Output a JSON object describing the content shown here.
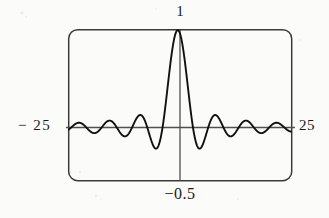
{
  "figure": {
    "kind": "graphing-calculator-plot",
    "frame": {
      "x": 68,
      "y": 29,
      "width": 224,
      "height": 152,
      "corner_radius": 9,
      "stroke": "#3a3a3a",
      "stroke_width": 1.4
    },
    "axis_color": "#4a4a4a",
    "curve_color": "#111111",
    "curve_width": 1.9,
    "background": "#fbfbf9"
  },
  "labels": {
    "top": "1",
    "bottom": "−0.5",
    "left": "− 25",
    "right": "25"
  },
  "chart_data": {
    "type": "line",
    "title": "",
    "xlabel": "",
    "ylabel": "",
    "xlim": [
      -25,
      25
    ],
    "ylim": [
      -0.33,
      1.0
    ],
    "grid": false,
    "legend": null,
    "x_tick_labels": [
      "− 25",
      "25"
    ],
    "y_tick_labels": [
      "1"
    ],
    "annotations": [
      {
        "text": "1",
        "position": "top-center",
        "meaning": "maximum value of the curve"
      },
      {
        "text": "−0.5",
        "position": "bottom-center",
        "meaning": "x-coordinate of the central peak / vertical cursor line"
      },
      {
        "text": "− 25",
        "position": "left",
        "meaning": "left x-window bound"
      },
      {
        "text": "25",
        "position": "right",
        "meaning": "right x-window bound"
      }
    ],
    "cursor_line": {
      "orientation": "vertical",
      "x": -0.5
    },
    "axis_line": {
      "orientation": "horizontal",
      "y": 0
    },
    "function": "damped oscillating sinc-like wave, peak 1 at x = -0.5",
    "series": [
      {
        "name": "sinc",
        "peak_value": 1,
        "peak_x": -0.5,
        "samples": 1400,
        "lobe_half_period": 3.4,
        "envelope": "1/|k*(x+0.5)|"
      }
    ]
  }
}
